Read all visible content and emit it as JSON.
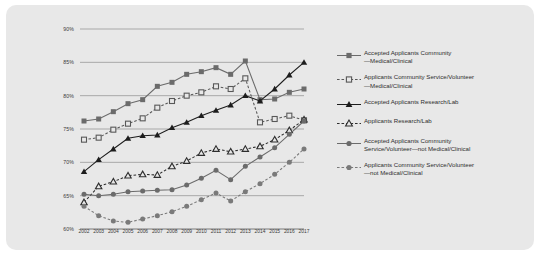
{
  "chart_data": {
    "type": "line",
    "title": "",
    "xlabel": "",
    "ylabel": "",
    "grid": true,
    "legend_position": "right",
    "ylim": [
      60,
      90
    ],
    "ytick_labels": [
      "90%",
      "85%",
      "80%",
      "75%",
      "70%",
      "65%",
      "60%"
    ],
    "ytick_values": [
      90,
      85,
      80,
      75,
      70,
      65,
      60
    ],
    "categories": [
      2002,
      2003,
      2004,
      2005,
      2006,
      2007,
      2008,
      2009,
      2010,
      2011,
      2012,
      2013,
      2014,
      2015,
      2016,
      2017
    ],
    "xtick_labels": [
      "2002",
      "2003",
      "2004",
      "2005",
      "2006",
      "2007",
      "2008",
      "2009",
      "2010",
      "2011",
      "2012",
      "2013",
      "2014",
      "2015",
      "2016",
      "2017"
    ],
    "series": [
      {
        "name": "Accepted Applicants Community—Medical/Clinical",
        "marker": "filled-square",
        "line": "solid",
        "color": "#6b6b6b",
        "values": [
          76.2,
          76.5,
          77.6,
          78.8,
          79.4,
          81.4,
          82.0,
          83.2,
          83.6,
          84.2,
          83.2,
          85.2,
          79.4,
          79.5,
          80.5,
          81.0
        ]
      },
      {
        "name": "Applicants Community Service/Volunteer—Medical/Clinical",
        "marker": "open-square",
        "line": "dashed",
        "color": "#585858",
        "values": [
          73.4,
          73.7,
          74.9,
          75.8,
          76.6,
          78.2,
          79.2,
          80.0,
          80.5,
          81.4,
          81.0,
          82.6,
          76.0,
          76.5,
          77.0,
          76.3
        ]
      },
      {
        "name": "Accepted Applicants Research/Lab",
        "marker": "filled-triangle",
        "line": "solid",
        "color": "#1d1d1d",
        "values": [
          68.6,
          70.4,
          72.0,
          73.6,
          74.0,
          74.1,
          75.2,
          76.0,
          77.0,
          77.8,
          78.6,
          80.0,
          79.2,
          81.0,
          83.1,
          85.0
        ]
      },
      {
        "name": "Applicants Research/Lab",
        "marker": "open-triangle",
        "line": "dashed",
        "color": "#2e2e2e",
        "values": [
          64.0,
          66.4,
          67.1,
          68.0,
          68.2,
          68.1,
          69.4,
          70.2,
          71.4,
          72.0,
          71.6,
          72.0,
          72.4,
          73.4,
          74.8,
          76.4
        ]
      },
      {
        "name": "Accepted Applicants Community Service/Volunteer—not Medical/Clinical",
        "marker": "filled-circle",
        "line": "solid",
        "color": "#6b6b6b",
        "values": [
          65.2,
          65.0,
          65.2,
          65.6,
          65.7,
          65.8,
          65.9,
          66.6,
          67.6,
          68.8,
          67.4,
          69.4,
          70.8,
          72.2,
          74.2,
          76.2
        ]
      },
      {
        "name": "Applicants Community Service/Volunteer—not Medical/Clinical",
        "marker": "filled-circle",
        "line": "dashed",
        "color": "#7a7a7a",
        "values": [
          63.4,
          62.0,
          61.2,
          61.0,
          61.5,
          62.0,
          62.6,
          63.4,
          64.4,
          65.4,
          64.2,
          65.6,
          66.8,
          68.2,
          70.0,
          72.0
        ]
      }
    ]
  },
  "legend": {
    "items": [
      {
        "line1": "Accepted Applicants Community",
        "line2": "—Medical/Clinical"
      },
      {
        "line1": "Applicants Community Service/Volunteer",
        "line2": "—Medical/Clinical"
      },
      {
        "line1": "Accepted Applicants Research/Lab",
        "line2": ""
      },
      {
        "line1": "Applicants Research/Lab",
        "line2": ""
      },
      {
        "line1": "Accepted Applicants Community",
        "line2": "Service/Volunteer—not Medical/Clinical"
      },
      {
        "line1": "Applicants Community Service/Volunteer",
        "line2": "—not Medical/Clinical"
      }
    ]
  }
}
